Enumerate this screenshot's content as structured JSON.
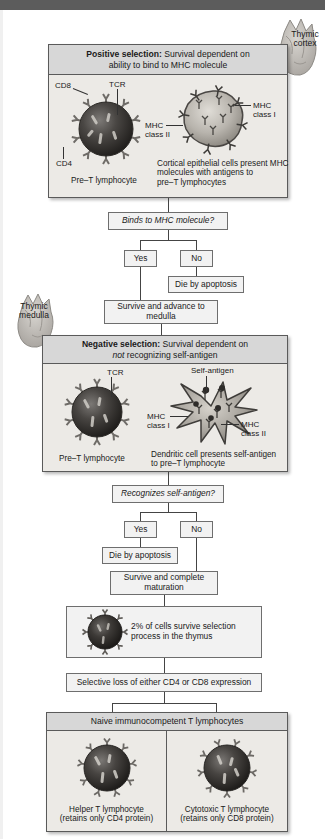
{
  "figure": {
    "type": "flowchart"
  },
  "organ_labels": {
    "cortex": "Thymic\ncortex",
    "cortex_line1": "Thymic",
    "cortex_line2": "cortex",
    "medulla_line1": "Thymic",
    "medulla_line2": "medulla"
  },
  "positive_panel": {
    "header_bold": "Positive selection:",
    "header_rest": " Survival dependent on",
    "header_line2": "ability to bind to MHC molecule",
    "left_cell": {
      "caption": "Pre–T lymphocyte",
      "labels": [
        "CD8",
        "TCR",
        "CD4"
      ]
    },
    "right_cell": {
      "labels": [
        "MHC\nclass I",
        "MHC\nclass II"
      ],
      "mhc1_line1": "MHC",
      "mhc1_line2": "class I",
      "mhc2_line1": "MHC",
      "mhc2_line2": "class II",
      "caption_line1": "Cortical epithelial cells present MHC",
      "caption_line2": "molecules with antigens to",
      "caption_line3": "pre–T lymphocytes"
    }
  },
  "decision1": {
    "question": "Binds to MHC molecule?",
    "yes": "Yes",
    "no": "No",
    "no_outcome": "Die by apoptosis",
    "yes_outcome_line1": "Survive and advance to",
    "yes_outcome_line2": "medulla"
  },
  "negative_panel": {
    "header_bold": "Negative selection:",
    "header_rest": " Survival dependent on",
    "header_line2_italic": "not",
    "header_line2_rest": " recognizing self-antigen",
    "left_cell": {
      "caption": "Pre–T lymphocyte",
      "labels": [
        "TCR"
      ]
    },
    "right_cell": {
      "self_antigen": "Self-antigen",
      "mhc1_line1": "MHC",
      "mhc1_line2": "class I",
      "mhc2_line1": "MHC",
      "mhc2_line2": "class II",
      "caption_line1": "Dendritic cell presents self-antigen",
      "caption_line2": "to pre–T lymphocyte"
    }
  },
  "decision2": {
    "question": "Recognizes self-antigen?",
    "yes": "Yes",
    "no": "No",
    "yes_outcome": "Die by apoptosis",
    "no_outcome_line1": "Survive and complete",
    "no_outcome_line2": "maturation"
  },
  "survival_box": {
    "line1": "2% of cells survive selection",
    "line2": "process in the thymus"
  },
  "selective_loss": {
    "text": "Selective loss of either CD4 or CD8 expression"
  },
  "naive_panel": {
    "header": "Naive immunocompetent T lymphocytes",
    "left": {
      "caption_line1": "Helper T lymphocyte",
      "caption_line2": "(retains only CD4 protein)"
    },
    "right": {
      "caption_line1": "Cytotoxic T lymphocyte",
      "caption_line2": "(retains only CD8 protein)"
    }
  },
  "colors": {
    "panel_bg": "#eceae6",
    "panel_head_bg": "#d7d7d7",
    "box_bg": "#f2f2f2",
    "border": "#5a5a5a",
    "line": "#444444",
    "top_bar": "#5c5c5c"
  }
}
